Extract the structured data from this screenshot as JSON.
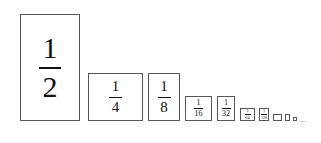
{
  "figure": {
    "name": "geometric-series-halving-rectangles",
    "background_color": "#ffffff",
    "border_color": "#565656",
    "text_color": "#111111",
    "baseline_y": 121,
    "ellipsis": "...",
    "terms": [
      {
        "label": "1/2",
        "numerator": "1",
        "denominator": "2",
        "x": 20,
        "y": 14,
        "w": 60,
        "h": 107,
        "size_class": "fs-1",
        "show_label": true
      },
      {
        "label": "1/4",
        "numerator": "1",
        "denominator": "4",
        "x": 88,
        "y": 73,
        "w": 55,
        "h": 48,
        "size_class": "fs-2",
        "show_label": true
      },
      {
        "label": "1/8",
        "numerator": "1",
        "denominator": "8",
        "x": 148,
        "y": 73,
        "w": 32,
        "h": 48,
        "size_class": "fs-3",
        "show_label": true
      },
      {
        "label": "1/16",
        "numerator": "1",
        "denominator": "16",
        "x": 185,
        "y": 96,
        "w": 27,
        "h": 25,
        "size_class": "fs-4",
        "show_label": true
      },
      {
        "label": "1/32",
        "numerator": "1",
        "denominator": "32",
        "x": 217,
        "y": 96,
        "w": 18,
        "h": 25,
        "size_class": "fs-5",
        "show_label": true
      },
      {
        "label": "1/64",
        "numerator": "1",
        "denominator": "64",
        "x": 240,
        "y": 108,
        "w": 15,
        "h": 13,
        "size_class": "fs-6",
        "show_label": true
      },
      {
        "label": "1/128",
        "numerator": "1",
        "denominator": "128",
        "x": 259,
        "y": 108,
        "w": 10,
        "h": 13,
        "size_class": "fs-7",
        "show_label": true
      },
      {
        "label": "1/256",
        "numerator": "1",
        "denominator": "256",
        "x": 273,
        "y": 114,
        "w": 9,
        "h": 7,
        "size_class": "fs-8",
        "show_label": false
      },
      {
        "label": "1/512",
        "numerator": "1",
        "denominator": "512",
        "x": 285,
        "y": 114,
        "w": 5,
        "h": 7,
        "size_class": "fs-9",
        "show_label": false
      },
      {
        "label": "1/1024",
        "numerator": "1",
        "denominator": "1024",
        "x": 293,
        "y": 117,
        "w": 4,
        "h": 4,
        "size_class": "fs-10",
        "show_label": false
      }
    ],
    "ellipsis_x": 300,
    "ellipsis_y": 117
  },
  "chart_data": {
    "type": "bar",
    "title": "",
    "subtitle": "",
    "xlabel": "",
    "ylabel": "",
    "grid": false,
    "legend": null,
    "categories": [
      "1/2",
      "1/4",
      "1/8",
      "1/16",
      "1/32",
      "1/64",
      "1/128",
      "1/256",
      "1/512",
      "1/1024"
    ],
    "values": [
      0.5,
      0.25,
      0.125,
      0.0625,
      0.03125,
      0.015625,
      0.0078125,
      0.00390625,
      0.001953125,
      0.0009765625
    ],
    "annotations": [
      "..."
    ],
    "note": "Each rectangle has half the area of the one before it; all share a common bottom baseline."
  }
}
